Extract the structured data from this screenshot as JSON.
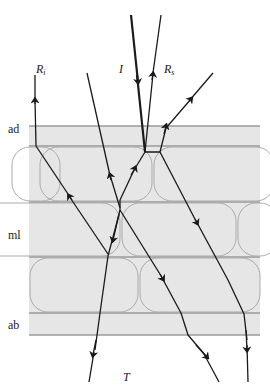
{
  "labels": {
    "incident": "I",
    "reflect_internal": "R",
    "reflect_internal_sub": "i",
    "reflect_specular": "R",
    "reflect_specular_sub": "s",
    "transmitted": "T",
    "layer_ad": "ad",
    "layer_ml": "ml",
    "layer_ab": "ab"
  },
  "colors": {
    "band": "#e4e4e4",
    "line": "#909090",
    "ray": "#1a1a1a",
    "cell": "#a8a8a8"
  }
}
